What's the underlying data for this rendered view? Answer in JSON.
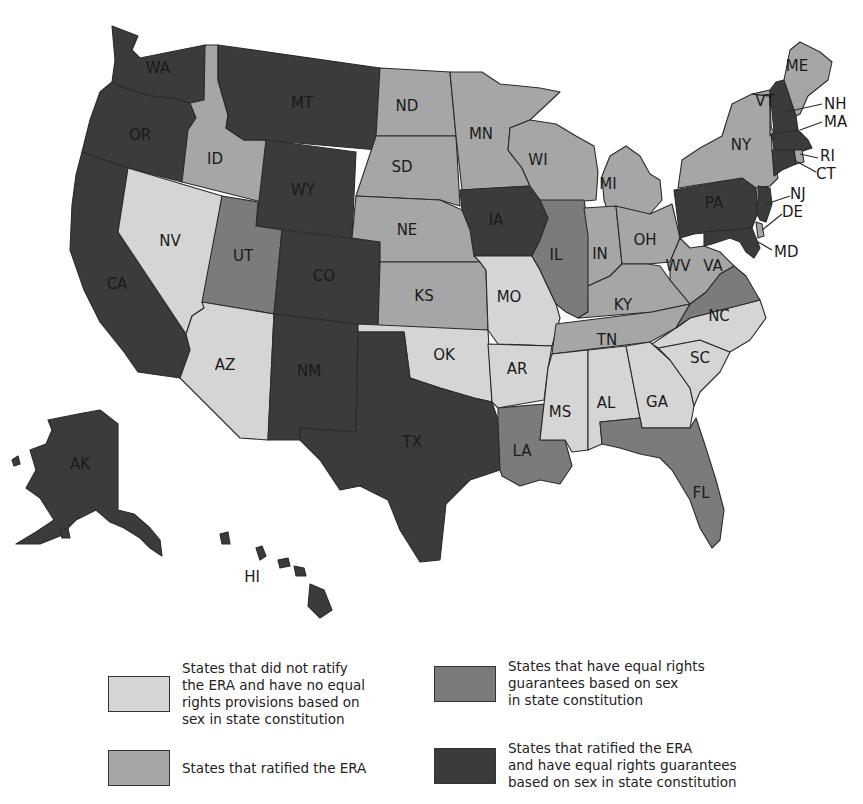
{
  "colors": {
    "none": "#d5d5d5",
    "era": "#a6a6a6",
    "const": "#7b7b7b",
    "both": "#3b3b3b"
  },
  "legend": [
    {
      "category": "none",
      "text": "States that did not ratify\nthe ERA and have no equal\nrights provisions based on\nsex in state constitution"
    },
    {
      "category": "era",
      "text": "States that ratified the ERA"
    },
    {
      "category": "const",
      "text": "States that have equal rights\nguarantees based on sex\nin state constitution"
    },
    {
      "category": "both",
      "text": "States that ratified the ERA\nand have equal rights guarantees\nbased on sex in state constitution"
    }
  ],
  "states": {
    "WA": {
      "label": "WA",
      "category": "both"
    },
    "OR": {
      "label": "OR",
      "category": "both"
    },
    "CA": {
      "label": "CA",
      "category": "both"
    },
    "ID": {
      "label": "ID",
      "category": "era"
    },
    "NV": {
      "label": "NV",
      "category": "none"
    },
    "MT": {
      "label": "MT",
      "category": "both"
    },
    "WY": {
      "label": "WY",
      "category": "both"
    },
    "UT": {
      "label": "UT",
      "category": "const"
    },
    "AZ": {
      "label": "AZ",
      "category": "none"
    },
    "CO": {
      "label": "CO",
      "category": "both"
    },
    "NM": {
      "label": "NM",
      "category": "both"
    },
    "ND": {
      "label": "ND",
      "category": "era"
    },
    "SD": {
      "label": "SD",
      "category": "era"
    },
    "NE": {
      "label": "NE",
      "category": "era"
    },
    "KS": {
      "label": "KS",
      "category": "era"
    },
    "OK": {
      "label": "OK",
      "category": "none"
    },
    "TX": {
      "label": "TX",
      "category": "both"
    },
    "MN": {
      "label": "MN",
      "category": "era"
    },
    "IA": {
      "label": "IA",
      "category": "both"
    },
    "MO": {
      "label": "MO",
      "category": "none"
    },
    "AR": {
      "label": "AR",
      "category": "none"
    },
    "LA": {
      "label": "LA",
      "category": "const"
    },
    "WI": {
      "label": "WI",
      "category": "era"
    },
    "IL": {
      "label": "IL",
      "category": "const"
    },
    "MI": {
      "label": "MI",
      "category": "era"
    },
    "IN": {
      "label": "IN",
      "category": "era"
    },
    "OH": {
      "label": "OH",
      "category": "era"
    },
    "KY": {
      "label": "KY",
      "category": "era"
    },
    "TN": {
      "label": "TN",
      "category": "era"
    },
    "MS": {
      "label": "MS",
      "category": "none"
    },
    "AL": {
      "label": "AL",
      "category": "none"
    },
    "GA": {
      "label": "GA",
      "category": "none"
    },
    "FL": {
      "label": "FL",
      "category": "const"
    },
    "SC": {
      "label": "SC",
      "category": "none"
    },
    "NC": {
      "label": "NC",
      "category": "none"
    },
    "VA": {
      "label": "VA",
      "category": "const"
    },
    "WV": {
      "label": "WV",
      "category": "era"
    },
    "PA": {
      "label": "PA",
      "category": "both"
    },
    "NY": {
      "label": "NY",
      "category": "era"
    },
    "VT": {
      "label": "VT",
      "category": "era"
    },
    "NH": {
      "label": "NH",
      "category": "both"
    },
    "ME": {
      "label": "ME",
      "category": "era"
    },
    "MA": {
      "label": "MA",
      "category": "both"
    },
    "RI": {
      "label": "RI",
      "category": "era"
    },
    "CT": {
      "label": "CT",
      "category": "both"
    },
    "NJ": {
      "label": "NJ",
      "category": "both"
    },
    "DE": {
      "label": "DE",
      "category": "era"
    },
    "MD": {
      "label": "MD",
      "category": "both"
    },
    "AK": {
      "label": "AK",
      "category": "both"
    },
    "HI": {
      "label": "HI",
      "category": "both"
    }
  }
}
